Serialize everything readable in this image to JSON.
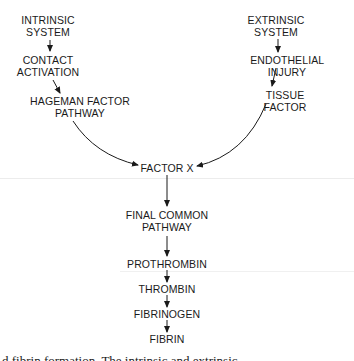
{
  "diagram": {
    "nodes": {
      "intrinsic_system": "INTRINSIC\nSYSTEM",
      "contact_activation": "CONTACT\nACTIVATION",
      "hageman_factor_pathway": "HAGEMAN FACTOR\nPATHWAY",
      "extrinsic_system": "EXTRINSIC\nSYSTEM",
      "endothelial_injury": "ENDOTHELIAL INJURY",
      "tissue_factor": "TISSUE FACTOR",
      "factor_x": "FACTOR X",
      "final_common_pathway": "FINAL COMMON\nPATHWAY",
      "prothrombin": "PROTHROMBIN",
      "thrombin": "THROMBIN",
      "fibrinogen": "FIBRINOGEN",
      "fibrin": "FIBRIN"
    },
    "edges": [
      [
        "intrinsic_system",
        "contact_activation"
      ],
      [
        "contact_activation",
        "hageman_factor_pathway"
      ],
      [
        "hageman_factor_pathway",
        "factor_x"
      ],
      [
        "extrinsic_system",
        "endothelial_injury"
      ],
      [
        "endothelial_injury",
        "tissue_factor"
      ],
      [
        "tissue_factor",
        "factor_x"
      ],
      [
        "factor_x",
        "final_common_pathway"
      ],
      [
        "final_common_pathway",
        "prothrombin"
      ],
      [
        "prothrombin",
        "thrombin"
      ],
      [
        "thrombin",
        "fibrinogen"
      ],
      [
        "fibrinogen",
        "fibrin"
      ]
    ],
    "caption_partial": "d          fibrin formation.  The      intrinsic     and     extrinsic"
  },
  "colors": {
    "ink": "#1a1a1a",
    "background": "#ffffff"
  }
}
